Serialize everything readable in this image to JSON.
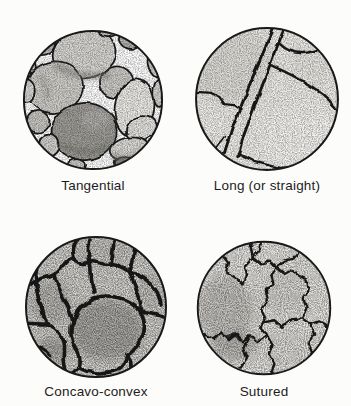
{
  "figure": {
    "name": "grain-contact-types",
    "panel_count": 4
  },
  "panels": [
    {
      "id": "tangential",
      "label": "Tangential"
    },
    {
      "id": "long-or-straight",
      "label": "Long (or straight)"
    },
    {
      "id": "concavo-convex",
      "label": "Concavo-convex"
    },
    {
      "id": "sutured",
      "label": "Sutured"
    }
  ],
  "colors": {
    "ink": "#1c1c1c",
    "paper": "#fcfcfa",
    "grain_dark": "#9d9c97",
    "grain_light": "#eae9e5",
    "field_light": "#edece8",
    "field_mid": "#dcdbd6"
  }
}
